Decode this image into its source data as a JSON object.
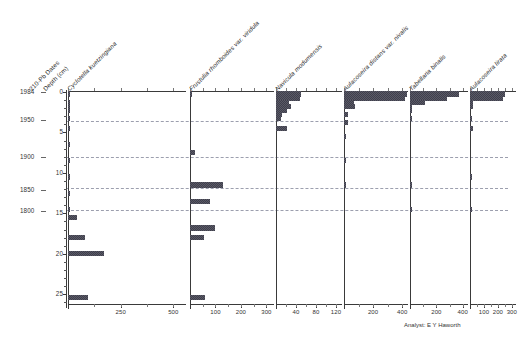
{
  "figure": {
    "analyst_note": "Analyst: E Y Haworth",
    "accent": "#4a4a58",
    "zone_line_color": "#8b8fa0"
  },
  "axes": {
    "date_axis_title": "210-Pb Dates",
    "depth_axis_title": "Depth (cm)",
    "year_ticks": [
      {
        "label": "1984",
        "depth": 0.0
      },
      {
        "label": "1950",
        "depth": 3.4
      },
      {
        "label": "1900",
        "depth": 8.0
      },
      {
        "label": "1850",
        "depth": 12.1
      },
      {
        "label": "1800",
        "depth": 14.7
      }
    ],
    "depth_ticks": [
      "0",
      "5",
      "10",
      "15",
      "20",
      "25"
    ],
    "depth_min": 0,
    "depth_max": 26.2,
    "zone_depths": [
      3.6,
      8.0,
      11.9,
      14.6
    ]
  },
  "chart_data": {
    "type": "bar",
    "title": "",
    "subtitle": "",
    "xlabel": "Relative abundance / counts",
    "ylabel": "Depth (cm)",
    "orientation": "horizontal",
    "grid": true,
    "legend_position": "none",
    "ylim": [
      0,
      26.2
    ],
    "depths": [
      0.25,
      0.75,
      1.25,
      1.75,
      2.25,
      2.75,
      3.25,
      3.75,
      4.5,
      5.5,
      6.5,
      7.5,
      8.5,
      9.5,
      10.5,
      11.5,
      12.5,
      13.5,
      14.5,
      15.5,
      16.8,
      18.0,
      20.0,
      25.4
    ],
    "series": [
      {
        "name": "Cyclotella kuetzingiana",
        "ticks": [
          0,
          250,
          500
        ],
        "tick_labels": [
          "",
          "250",
          "500"
        ],
        "xlim": [
          0,
          560
        ],
        "values": [
          4,
          0,
          10,
          10,
          10,
          0,
          10,
          0,
          10,
          0,
          10,
          0,
          7,
          0,
          7,
          0,
          10,
          0,
          10,
          45,
          0,
          80,
          170,
          95
        ]
      },
      {
        "name": "Frustulia rhomboides var. viridula",
        "ticks": [
          0,
          100,
          200,
          300
        ],
        "tick_labels": [
          "",
          "100",
          "200",
          "300"
        ],
        "xlim": [
          0,
          330
        ],
        "values": [
          4,
          0,
          0,
          0,
          0,
          0,
          0,
          0,
          0,
          0,
          0,
          18,
          0,
          0,
          0,
          130,
          0,
          78,
          0,
          0,
          100,
          55,
          0,
          58
        ]
      },
      {
        "name": "Navicula modumensis",
        "ticks": [
          0,
          40,
          80,
          120
        ],
        "tick_labels": [
          "",
          "40",
          "80",
          "120"
        ],
        "xlim": [
          0,
          132
        ],
        "values": [
          50,
          48,
          25,
          30,
          22,
          12,
          10,
          0,
          22,
          0,
          0,
          0,
          0,
          0,
          0,
          0,
          0,
          0,
          0,
          0,
          0,
          0,
          0,
          0
        ]
      },
      {
        "name": "Aulacoseira distans var. nivalis",
        "ticks": [
          0,
          200,
          400
        ],
        "tick_labels": [
          "",
          "200",
          "400"
        ],
        "xlim": [
          0,
          440
        ],
        "values": [
          430,
          420,
          70,
          78,
          0,
          28,
          0,
          30,
          0,
          16,
          0,
          0,
          12,
          0,
          0,
          12,
          0,
          0,
          0,
          0,
          0,
          0,
          0,
          0
        ]
      },
      {
        "name": "Tabellaria binalis",
        "ticks": [
          0,
          200,
          400
        ],
        "tick_labels": [
          "",
          "200",
          "400"
        ],
        "xlim": [
          0,
          440
        ],
        "values": [
          370,
          280,
          110,
          14,
          10,
          0,
          12,
          0,
          0,
          0,
          0,
          0,
          0,
          0,
          0,
          10,
          0,
          0,
          10,
          0,
          0,
          0,
          0,
          0
        ]
      },
      {
        "name": "Aulacoseira lirata",
        "ticks": [
          0,
          100,
          200,
          300
        ],
        "tick_labels": [
          "",
          "100",
          "200",
          "300"
        ],
        "xlim": [
          0,
          330
        ],
        "values": [
          250,
          240,
          18,
          18,
          0,
          0,
          12,
          0,
          18,
          0,
          0,
          0,
          0,
          0,
          10,
          0,
          0,
          0,
          12,
          0,
          0,
          0,
          0,
          0
        ]
      }
    ]
  }
}
